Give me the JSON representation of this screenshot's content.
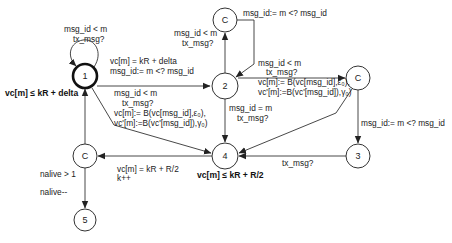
{
  "diagram": {
    "nodes": [
      {
        "id": "n1",
        "label": "1",
        "initial": true
      },
      {
        "id": "n2",
        "label": "2"
      },
      {
        "id": "cTop",
        "label": "C"
      },
      {
        "id": "cRight",
        "label": "C"
      },
      {
        "id": "n3",
        "label": "3"
      },
      {
        "id": "n4",
        "label": "4"
      },
      {
        "id": "cLeft",
        "label": "C"
      },
      {
        "id": "n5",
        "label": "5"
      }
    ],
    "invariants": {
      "n1": "vc[m] ≤ kR + delta",
      "n4": "vc[m] ≤ kR + R/2"
    },
    "edges": {
      "self_loop_1": [
        "msg_id < m",
        "tx_msg?"
      ],
      "e1_2": [
        "vc[m] = kR + delta",
        "msg_id:= m <? msg_id"
      ],
      "e2_cTop": [
        "msg_id < m",
        "tx_msg?"
      ],
      "ecTop_2": [
        "msg_id:= m <? msg_id"
      ],
      "e2_cRight": [
        "msg_id < m",
        "tx_msg?",
        "vc[m]:= B(vc[msg_id],ε₀),",
        "vc'[m]:=B(vc'[msg_id]),γ₀)"
      ],
      "e1_4": [
        "msg_id < m",
        "tx_msg?",
        "vc[m]:= B(vc[msg_id],ε₀),",
        "vc'[m]:=B(vc'[msg_id]),γ₀)"
      ],
      "e2_4": [
        "msg_id = m",
        "tx_msg?"
      ],
      "ecRight_3": [
        "msg_id:= m <? msg_id"
      ],
      "e3_4": [
        "tx_msg?"
      ],
      "e4_cLeft": [
        "vc[m] = kR + R/2",
        "k++"
      ],
      "ecLeft_5": [
        "nalive > 1",
        "nalive--"
      ]
    }
  }
}
